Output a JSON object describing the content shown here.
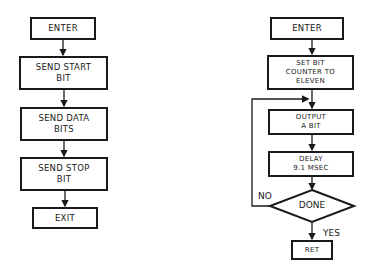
{
  "left_flowchart": {
    "nodes": [
      {
        "id": "enter",
        "label": "ENTER"
      },
      {
        "id": "send_start",
        "label": "SEND START\nBIT"
      },
      {
        "id": "send_data",
        "label": "SEND DATA\nBITS"
      },
      {
        "id": "send_stop",
        "label": "SEND STOP\nBIT"
      },
      {
        "id": "exit",
        "label": "EXIT"
      }
    ]
  },
  "right_flowchart": {
    "nodes": [
      {
        "id": "enter",
        "label": "ENTER"
      },
      {
        "id": "set_counter",
        "label": "SET BIT\nCOUNTER TO\nELEVEN"
      },
      {
        "id": "output_bit",
        "label": "OUTPUT\nA BIT"
      },
      {
        "id": "delay",
        "label": "DELAY\n9.1 MSEC"
      },
      {
        "id": "done",
        "label": "DONE"
      },
      {
        "id": "ret",
        "label": "RET"
      }
    ],
    "branch_labels": {
      "no": "NO",
      "yes": "YES"
    }
  },
  "colors": {
    "ink": "#1a1a1a",
    "background": "#ffffff"
  }
}
